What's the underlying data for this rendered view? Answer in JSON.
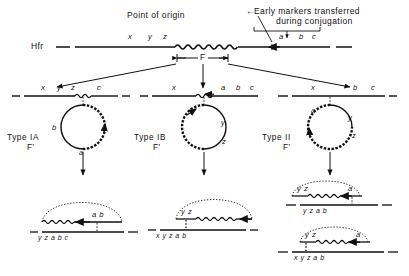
{
  "figure": {
    "kind": "genetics-diagram",
    "ink_color": "#111111"
  },
  "annotations": {
    "point_of_origin": "Point of origin",
    "early_markers_line1": "Early markers transferred",
    "early_markers_line2": "during conjugation",
    "arrow_glyph": "←"
  },
  "hfr": {
    "label": "Hfr",
    "left_markers": [
      "x",
      "y",
      "z"
    ],
    "right_markers": [
      "a",
      "b",
      "c"
    ],
    "f_label": "F"
  },
  "types": [
    {
      "id": "IA",
      "name": "Type IA",
      "state": "F'",
      "chromosome_markers": [
        "x",
        "y",
        "z",
        "c"
      ],
      "episome_markers": [
        "b",
        "a"
      ],
      "episome_wavy_side": "right"
    },
    {
      "id": "IB",
      "name": "Type IB",
      "state": "F'",
      "chromosome_markers": [
        "x",
        "a",
        "b",
        "c"
      ],
      "episome_markers": [
        "y",
        "z"
      ],
      "episome_wavy_side": "left"
    },
    {
      "id": "II",
      "name": "Type II",
      "state": "F'",
      "chromosome_markers": [
        "x",
        "b",
        "c"
      ],
      "episome_markers": [
        "a",
        "y",
        "z"
      ],
      "episome_wavy_side": "left-bottom"
    }
  ],
  "merozygotes": [
    {
      "id": "IA-product",
      "top_markers_left": "",
      "top_markers_right": "a  b",
      "bottom_markers": "y    z    a    b    c"
    },
    {
      "id": "IB-product",
      "top_markers_left": "y  z",
      "top_markers_right": "",
      "bottom_markers": "x   y   z   a   b"
    },
    {
      "id": "II-product-1",
      "top_markers_left": "y z",
      "top_markers_right": "a",
      "bottom_markers": "y   z   a   b"
    },
    {
      "id": "II-product-2",
      "top_markers_left": "y z",
      "top_markers_right": "a",
      "bottom_markers": "x  y  z   a   b"
    }
  ]
}
